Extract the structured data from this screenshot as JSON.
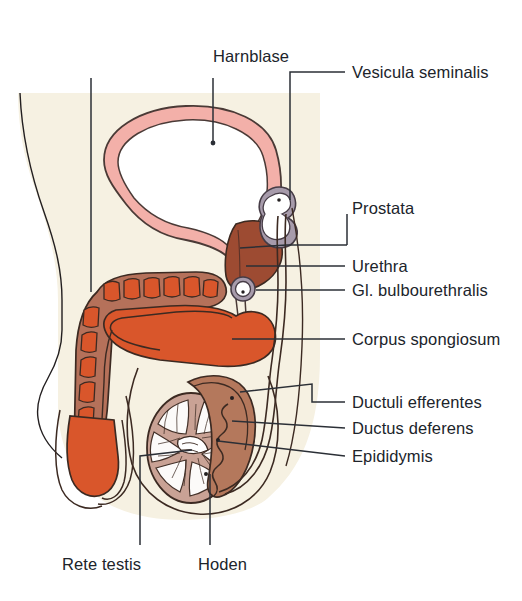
{
  "figure": {
    "language": "de",
    "type": "anatomical-diagram",
    "width": 522,
    "height": 601
  },
  "palette": {
    "background": "#ffffff",
    "body_tint": "#f6f1e2",
    "bladder_wall": "#f3b0a9",
    "bladder_lumen": "#ffffff",
    "prostate": "#9d4b32",
    "erectile_orange": "#d9562b",
    "epididymis": "#b4785c",
    "seminal_vesicle": "#a79bab",
    "testis_parenchyma": "#c9a295",
    "ink": "#231f20",
    "text": "#20242b"
  },
  "labels": {
    "corpus_cavernosum": {
      "line1": "Corpus",
      "line2": "cavernosus"
    },
    "harnblase": "Harnblase",
    "vesicula_seminalis": "Vesicula seminalis",
    "prostata": "Prostata",
    "urethra": "Urethra",
    "gl_bulbourethralis": "Gl. bulbourethralis",
    "corpus_spongiosum": "Corpus spongiosum",
    "ductuli_efferentes": "Ductuli efferentes",
    "ductus_deferens": "Ductus deferens",
    "epididymis": "Epididymis",
    "rete_testis": "Rete testis",
    "hoden": "Hoden"
  },
  "structures": [
    {
      "name": "corpus-cavernosum",
      "label": "Corpus cavernosus",
      "color": "#d9562b",
      "side": "left"
    },
    {
      "name": "harnblase",
      "label": "Harnblase",
      "color": "#f3b0a9",
      "side": "top"
    },
    {
      "name": "vesicula-seminalis",
      "label": "Vesicula seminalis",
      "color": "#a79bab",
      "side": "right"
    },
    {
      "name": "prostata",
      "label": "Prostata",
      "color": "#9d4b32",
      "side": "right"
    },
    {
      "name": "urethra",
      "label": "Urethra",
      "color": "#ffffff",
      "side": "right"
    },
    {
      "name": "gl-bulbourethralis",
      "label": "Gl. bulbourethralis",
      "color": "#a79bab",
      "side": "right"
    },
    {
      "name": "corpus-spongiosum",
      "label": "Corpus spongiosum",
      "color": "#d9562b",
      "side": "right"
    },
    {
      "name": "ductuli-efferentes",
      "label": "Ductuli efferentes",
      "color": "#b4785c",
      "side": "right"
    },
    {
      "name": "ductus-deferens",
      "label": "Ductus deferens",
      "color": "#ffffff",
      "side": "right"
    },
    {
      "name": "epididymis",
      "label": "Epididymis",
      "color": "#b4785c",
      "side": "right"
    },
    {
      "name": "rete-testis",
      "label": "Rete testis",
      "color": "#c9a295",
      "side": "bottom"
    },
    {
      "name": "hoden",
      "label": "Hoden",
      "color": "#c9a295",
      "side": "bottom"
    }
  ]
}
